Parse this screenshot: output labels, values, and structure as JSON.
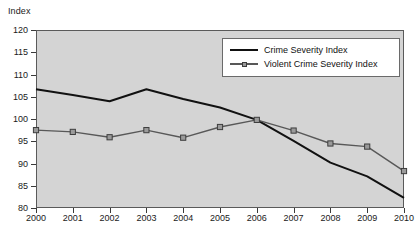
{
  "chart_data": {
    "type": "line",
    "title": "",
    "xlabel": "",
    "ylabel": "Index",
    "categories": [
      "2000",
      "2001",
      "2002",
      "2003",
      "2004",
      "2005",
      "2006",
      "2007",
      "2008",
      "2009",
      "2010"
    ],
    "x": [
      2000,
      2001,
      2002,
      2003,
      2004,
      2005,
      2006,
      2007,
      2008,
      2009,
      2010
    ],
    "xlim": [
      2000,
      2010
    ],
    "ylim": [
      80,
      120
    ],
    "yticks": [
      "120",
      "115",
      "110",
      "105",
      "100",
      "95",
      "90",
      "85",
      "80"
    ],
    "ytick_values": [
      120,
      115,
      110,
      105,
      100,
      95,
      90,
      85,
      80
    ],
    "grid": false,
    "legend_position": "upper-right",
    "series": [
      {
        "name": "Crime Severity Index",
        "marker": "none",
        "color": "#111111",
        "values": [
          106.7,
          105.4,
          104.0,
          106.7,
          104.5,
          102.6,
          99.8,
          95.1,
          90.2,
          87.1,
          82.3
        ]
      },
      {
        "name": "Violent Crime Severity Index",
        "marker": "square",
        "color": "#585858",
        "values": [
          97.5,
          97.1,
          95.9,
          97.5,
          95.8,
          98.2,
          99.8,
          97.4,
          94.5,
          93.8,
          88.3
        ]
      }
    ]
  },
  "legend": {
    "entries": [
      {
        "label": "Crime Severity Index"
      },
      {
        "label": "Violent Crime Severity Index"
      }
    ]
  }
}
